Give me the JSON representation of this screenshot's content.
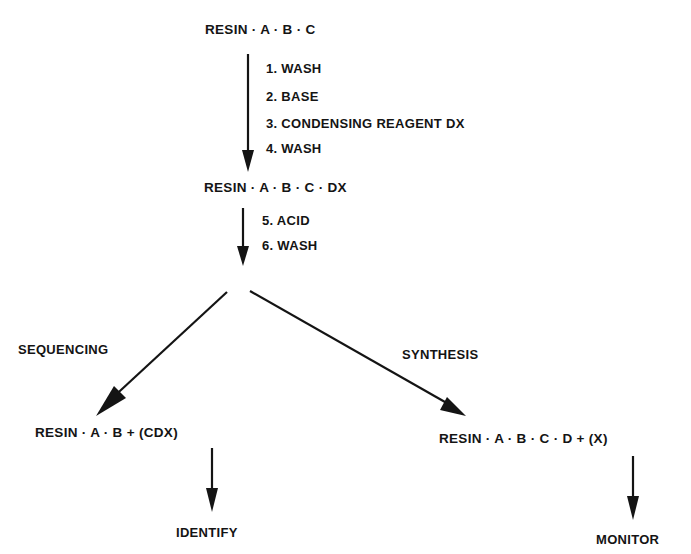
{
  "diagram": {
    "type": "flowchart",
    "nodes": {
      "start": {
        "label": "RESIN · A · B · C"
      },
      "intermediate": {
        "label": "RESIN · A · B · C · DX"
      },
      "sequencing_product": {
        "label": "RESIN · A · B + (CDX)"
      },
      "synthesis_product": {
        "label": "RESIN · A · B · C · D + (X)"
      },
      "identify": {
        "label": "IDENTIFY"
      },
      "monitor": {
        "label": "MONITOR"
      }
    },
    "steps_group_1": [
      {
        "label": "1. WASH"
      },
      {
        "label": "2. BASE"
      },
      {
        "label": "3. CONDENSING REAGENT DX"
      },
      {
        "label": "4. WASH"
      }
    ],
    "steps_group_2": [
      {
        "label": "5. ACID"
      },
      {
        "label": "6. WASH"
      }
    ],
    "branches": {
      "left": {
        "label": "SEQUENCING"
      },
      "right": {
        "label": "SYNTHESIS"
      }
    },
    "colors": {
      "ink": "#141414",
      "background": "#ffffff"
    },
    "edges": [
      {
        "from": "start",
        "to": "intermediate",
        "via": "steps_group_1"
      },
      {
        "from": "intermediate",
        "to": "branch_point",
        "via": "steps_group_2"
      },
      {
        "from": "branch_point",
        "to": "sequencing_product",
        "label": "SEQUENCING"
      },
      {
        "from": "branch_point",
        "to": "synthesis_product",
        "label": "SYNTHESIS"
      },
      {
        "from": "sequencing_product",
        "to": "identify"
      },
      {
        "from": "synthesis_product",
        "to": "monitor"
      }
    ]
  }
}
